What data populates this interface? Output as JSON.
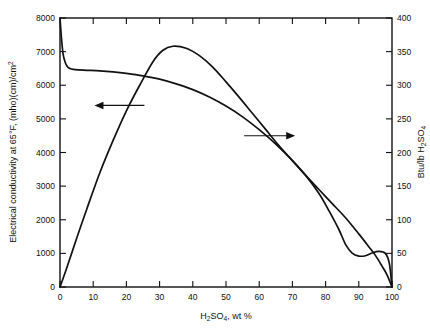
{
  "chart_data": {
    "type": "line",
    "title": "",
    "xlabel": "H2SO4, wt %",
    "xlabel_parts": {
      "pre": "H",
      "sub1": "2",
      "mid": "SO",
      "sub2": "4",
      "post": ", wt %"
    },
    "ylabel_left_parts": {
      "pre": "Electrical conductivity at 65",
      "deg": "°",
      "mid": "F,  (mho)(cm)/cm",
      "sup": "2"
    },
    "ylabel_left": "Electrical conductivity at 65°F, (mho)(cm)/cm2",
    "ylabel_right": "Btu/lb H2SO4",
    "ylabel_right_parts": {
      "pre": "Btu/lb H",
      "sub1": "2",
      "mid": "SO",
      "sub2": "4"
    },
    "xlim": [
      0,
      100
    ],
    "ylim_left": [
      0,
      8000
    ],
    "ylim_right": [
      0,
      400
    ],
    "xticks": [
      0,
      10,
      20,
      30,
      40,
      50,
      60,
      70,
      80,
      90,
      100
    ],
    "xticklabels": [
      "0",
      "10",
      "20",
      "30",
      "40",
      "50",
      "60",
      "70",
      "80",
      "90",
      "100"
    ],
    "yticks_left": [
      0,
      1000,
      2000,
      3000,
      4000,
      5000,
      6000,
      7000,
      8000
    ],
    "yticklabels_left": [
      "0",
      "1000",
      "2000",
      "3000",
      "4000",
      "5000",
      "6000",
      "7000",
      "8000"
    ],
    "yticks_right": [
      0,
      50,
      100,
      150,
      200,
      250,
      300,
      350,
      400
    ],
    "yticklabels_right": [
      "0",
      "50",
      "100",
      "150",
      "200",
      "250",
      "300",
      "350",
      "400"
    ],
    "grid": false,
    "legend": "none",
    "frame": "box",
    "annotations": [
      {
        "name": "left-axis-arrow",
        "text": "",
        "icon": "arrow-left",
        "points_to": "left-y-axis",
        "x": 17,
        "y_left": 5400
      },
      {
        "name": "right-axis-arrow",
        "text": "",
        "icon": "arrow-right",
        "points_to": "right-y-axis",
        "x": 63,
        "y_right": 225
      }
    ],
    "series": [
      {
        "name": "Electrical conductivity at 65 F",
        "axis": "left",
        "units": "(mho)(cm)/cm^2",
        "x": [
          0,
          0.4,
          0.9,
          1.5,
          2.2,
          3.0,
          4.0,
          5.5,
          8,
          12,
          16,
          20,
          25,
          30,
          35,
          40,
          45,
          50,
          55,
          60,
          65,
          70,
          74,
          78,
          81,
          84,
          86,
          88,
          90,
          92,
          94,
          96,
          98,
          99.2,
          100
        ],
        "y": [
          8000,
          7450,
          6950,
          6700,
          6560,
          6500,
          6470,
          6455,
          6445,
          6430,
          6400,
          6355,
          6280,
          6180,
          6040,
          5870,
          5650,
          5380,
          5060,
          4680,
          4250,
          3760,
          3320,
          2780,
          2270,
          1710,
          1270,
          1010,
          920,
          930,
          1010,
          1060,
          1000,
          700,
          0
        ]
      },
      {
        "name": "Btu/lb H2SO4",
        "axis": "right",
        "units": "Btu/lb H2SO4",
        "x": [
          0,
          2,
          5,
          8,
          12,
          16,
          20,
          24,
          28,
          31,
          34,
          38,
          42,
          46,
          50,
          54,
          58,
          62,
          66,
          70,
          74,
          78,
          82,
          86,
          90,
          93,
          95,
          97,
          98.5,
          100
        ],
        "y": [
          0,
          28,
          72,
          115,
          170,
          218,
          262,
          300,
          335,
          352,
          358,
          355,
          344,
          327,
          305,
          282,
          258,
          234,
          210,
          188,
          166,
          145,
          124,
          103,
          79,
          60,
          47,
          31,
          18,
          0
        ]
      }
    ]
  },
  "figure": {
    "background_color": "#ffffff",
    "line_color": "#111111",
    "plot_left_px": 60,
    "plot_right_px": 392,
    "plot_top_px": 18,
    "plot_bottom_px": 287
  }
}
